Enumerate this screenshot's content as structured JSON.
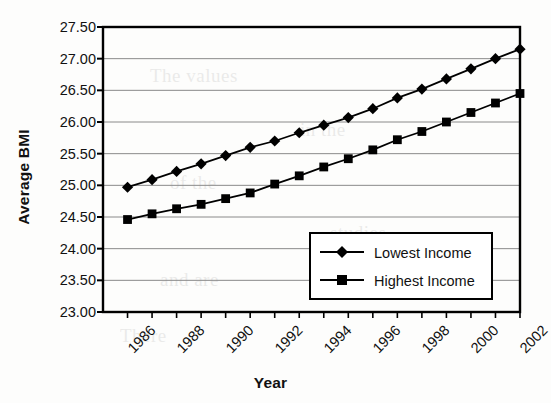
{
  "chart_data": {
    "type": "line",
    "title": "",
    "xlabel": "Year",
    "ylabel": "Average BMI",
    "xlim": [
      1986,
      2003
    ],
    "ylim": [
      23.0,
      27.5
    ],
    "ytick_step": 0.5,
    "grid": "horizontal",
    "legend_position": "lower-right-inside",
    "ytick_labels": [
      "27.50",
      "27.00",
      "26.50",
      "26.00",
      "25.50",
      "25.00",
      "24.50",
      "24.00",
      "23.50",
      "23.00"
    ],
    "ytick_values": [
      27.5,
      27.0,
      26.5,
      26.0,
      25.5,
      25.0,
      24.5,
      24.0,
      23.5,
      23.0
    ],
    "xtick_labels": [
      "1986",
      "1988",
      "1990",
      "1992",
      "1994",
      "1996",
      "1998",
      "2000",
      "2002"
    ],
    "xtick_values": [
      1986,
      1988,
      1990,
      1992,
      1994,
      1996,
      1998,
      2000,
      2002
    ],
    "x": [
      1987,
      1988,
      1989,
      1990,
      1991,
      1992,
      1993,
      1994,
      1995,
      1996,
      1997,
      1998,
      1999,
      2000,
      2001,
      2002,
      2003
    ],
    "series": [
      {
        "name": "Lowest Income",
        "marker": "diamond",
        "color": "#000000",
        "values": [
          24.97,
          25.09,
          25.22,
          25.34,
          25.47,
          25.6,
          25.7,
          25.83,
          25.95,
          26.07,
          26.21,
          26.38,
          26.52,
          26.68,
          26.84,
          27.0,
          27.15
        ]
      },
      {
        "name": "Highest Income",
        "marker": "square",
        "color": "#000000",
        "values": [
          24.46,
          24.55,
          24.63,
          24.7,
          24.79,
          24.88,
          25.02,
          25.15,
          25.29,
          25.42,
          25.56,
          25.72,
          25.85,
          26.0,
          26.15,
          26.3,
          26.45
        ]
      }
    ]
  },
  "legend": {
    "entries": [
      {
        "label": "Lowest Income",
        "marker": "diamond"
      },
      {
        "label": "Highest Income",
        "marker": "square"
      }
    ]
  },
  "background_text": [
    "The values",
    "in the",
    "of the",
    "studies",
    "and are",
    "There"
  ]
}
